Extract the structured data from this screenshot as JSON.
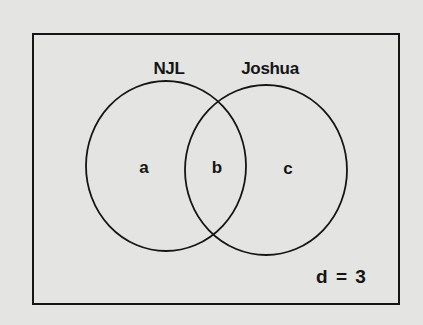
{
  "diagram": {
    "type": "venn",
    "universe": {
      "label": "d = 3",
      "region": "d",
      "value": 3
    },
    "sets": [
      {
        "name": "NJL",
        "label": "NJL"
      },
      {
        "name": "Joshua",
        "label": "Joshua"
      }
    ],
    "regions": [
      {
        "id": "a",
        "label": "a",
        "description": "NJL only"
      },
      {
        "id": "b",
        "label": "b",
        "description": "NJL and Joshua"
      },
      {
        "id": "c",
        "label": "c",
        "description": "Joshua only"
      }
    ],
    "colors": {
      "background": "#e4e4e2",
      "stroke": "#151515",
      "text": "#151515"
    }
  }
}
